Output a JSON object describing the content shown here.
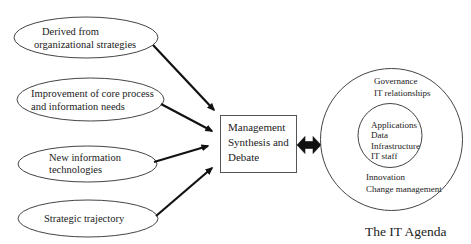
{
  "diagram": {
    "inputs": [
      {
        "id": "derived",
        "lines": [
          "Derived from",
          "organizational strategies"
        ]
      },
      {
        "id": "improvement",
        "lines": [
          "Improvement of core process",
          "and information needs"
        ]
      },
      {
        "id": "new-tech",
        "lines": [
          "New information",
          "technologies"
        ]
      },
      {
        "id": "trajectory",
        "lines": [
          "Strategic trajectory"
        ]
      }
    ],
    "center_box": {
      "lines": [
        "Management",
        "Synthesis and",
        "Debate"
      ]
    },
    "it_agenda": {
      "outer_top": [
        "Governance",
        "IT relationships"
      ],
      "inner": [
        "Applications",
        "Data",
        "Infrastructure",
        "IT staff"
      ],
      "outer_bottom": [
        "Innovation",
        "Change management"
      ],
      "title": "The IT Agenda"
    },
    "colors": {
      "stroke": "#333333",
      "arrow": "#111111",
      "text": "#222222",
      "background": "#ffffff"
    }
  }
}
